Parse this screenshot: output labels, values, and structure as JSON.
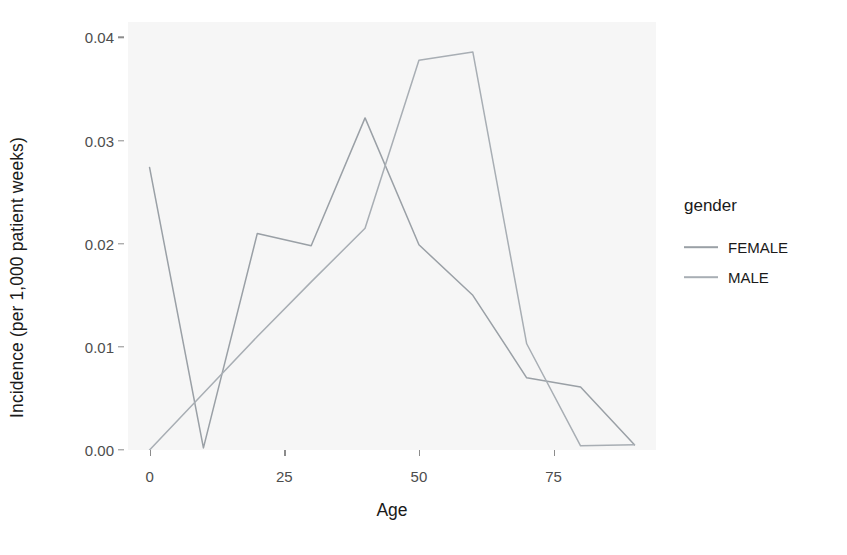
{
  "chart_data": {
    "type": "line",
    "title": "",
    "subtitle": "",
    "xlabel": "Age",
    "ylabel": "Incidence (per 1,000 patient weeks)",
    "xlim": [
      -4,
      94
    ],
    "ylim": [
      0.0,
      0.0415
    ],
    "xticks": [
      0,
      25,
      50,
      75
    ],
    "xtick_labels": [
      "0",
      "25",
      "50",
      "75"
    ],
    "yticks": [
      0.0,
      0.01,
      0.02,
      0.03,
      0.04
    ],
    "ytick_labels": [
      "0.00",
      "0.01",
      "0.02",
      "0.03",
      "0.04"
    ],
    "grid": false,
    "panel_background": "#f6f6f6",
    "legend": {
      "title": "gender",
      "position": "right",
      "entries": [
        {
          "name": "FEMALE",
          "color": "#9aa0a6"
        },
        {
          "name": "MALE",
          "color": "#a8aeb4"
        }
      ]
    },
    "series": [
      {
        "name": "FEMALE",
        "color": "#9aa0a6",
        "x": [
          0,
          10,
          20,
          30,
          40,
          50,
          60,
          70,
          80,
          90
        ],
        "y": [
          0.0274,
          0.0002,
          0.021,
          0.0198,
          0.0322,
          0.0199,
          0.015,
          0.007,
          0.0061,
          0.0005
        ]
      },
      {
        "name": "MALE",
        "color": "#a8aeb4",
        "x": [
          0,
          10,
          20,
          30,
          40,
          50,
          60,
          70,
          80,
          90
        ],
        "y": [
          0.0,
          0.0055,
          0.011,
          0.0163,
          0.0215,
          0.0378,
          0.0386,
          0.0103,
          0.0004,
          0.0005
        ]
      }
    ]
  },
  "axis": {
    "x_title": "Age",
    "y_title": "Incidence (per 1,000 patient weeks)"
  }
}
